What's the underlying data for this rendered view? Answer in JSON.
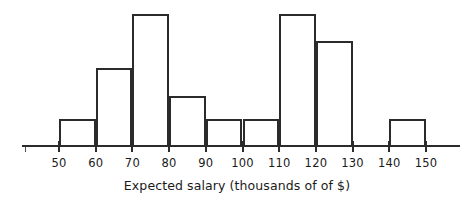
{
  "chart_data": {
    "type": "bar",
    "title": "",
    "subtitle": "",
    "xlabel": "Expected salary (thousands of of $)",
    "ylabel": "",
    "grid": false,
    "legend": null,
    "legend_position": "none",
    "bin_width": 10,
    "bin_edges": [
      50,
      60,
      70,
      80,
      90,
      100,
      110,
      120,
      130,
      140,
      150
    ],
    "categories": [
      "50-60",
      "60-70",
      "70-80",
      "80-90",
      "90-100",
      "100-110",
      "110-120",
      "120-130",
      "130-140",
      "140-150"
    ],
    "values": [
      2,
      6,
      10,
      4,
      2,
      2,
      10,
      8,
      0,
      2
    ],
    "bar_pixel_heights": [
      26,
      77,
      131,
      49,
      26,
      26,
      131,
      104,
      0,
      26
    ],
    "xlim": [
      40,
      160
    ],
    "ylim": [
      0,
      10
    ],
    "xticks": [
      50,
      60,
      70,
      80,
      90,
      100,
      110,
      120,
      130,
      140,
      150
    ],
    "xtick_labels": [
      "50",
      "60",
      "70",
      "80",
      "90",
      "100",
      "110",
      "120",
      "130",
      "140",
      "150"
    ],
    "yticks": [],
    "ytick_labels": [],
    "colors": {
      "bar_stroke": "#2b2b2b",
      "bar_fill": "transparent",
      "axis": "#2b2b2b",
      "text": "#1a1a1a",
      "background": "#ffffff"
    }
  },
  "axis": {
    "x_title": "Expected salary (thousands of of $)"
  }
}
